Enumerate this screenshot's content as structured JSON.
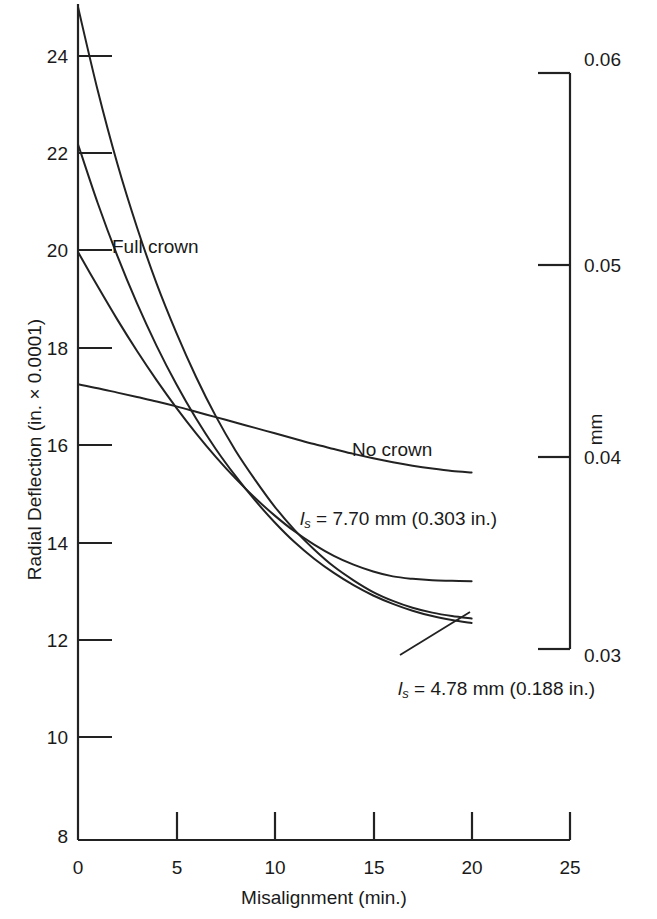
{
  "chart_data": {
    "type": "line",
    "title": "",
    "xlabel": "Misalignment (min.)",
    "ylabel": "Radial Deflection (in. × 0.0001)",
    "ylabel_right": "mm",
    "xlim": [
      0,
      25
    ],
    "ylim": [
      8,
      25
    ],
    "ylim_right": [
      0.03,
      0.06
    ],
    "xticks": [
      "0",
      "5",
      "10",
      "15",
      "20",
      "25"
    ],
    "xtick_values": [
      0,
      5,
      10,
      15,
      20,
      25
    ],
    "yticks": [
      "8",
      "10",
      "12",
      "14",
      "16",
      "18",
      "20",
      "22",
      "24"
    ],
    "ytick_values": [
      8,
      10,
      12,
      14,
      16,
      18,
      20,
      22,
      24
    ],
    "yticks_right": [
      "0.03",
      "0.04",
      "0.05",
      "0.06"
    ],
    "ytick_right_values": [
      0.03,
      0.04,
      0.05,
      0.06
    ],
    "grid": false,
    "legend": "inline-annotations",
    "x": [
      0,
      1,
      2,
      3,
      4,
      5,
      6,
      7,
      8,
      9,
      10,
      11,
      12,
      13,
      14,
      15,
      16,
      17,
      18,
      19,
      20
    ],
    "series": [
      {
        "name": "No crown",
        "label": "No crown",
        "values": [
          17.3,
          17.22,
          17.13,
          17.04,
          16.95,
          16.85,
          16.74,
          16.63,
          16.52,
          16.41,
          16.3,
          16.19,
          16.08,
          15.98,
          15.88,
          15.79,
          15.71,
          15.64,
          15.58,
          15.53,
          15.5
        ]
      },
      {
        "name": "ls = 7.70 mm (0.303 in.)",
        "label_main": "= 7.70 mm (0.303 in.)",
        "label_symbol": "l",
        "label_sub": "s",
        "values": [
          20.0,
          19.3,
          18.62,
          17.98,
          17.38,
          16.82,
          16.3,
          15.82,
          15.38,
          14.98,
          14.62,
          14.3,
          14.03,
          13.8,
          13.62,
          13.48,
          13.38,
          13.33,
          13.3,
          13.29,
          13.28
        ]
      },
      {
        "name": "Full crown",
        "label": "Full crown",
        "values": [
          25.0,
          23.3,
          21.8,
          20.5,
          19.35,
          18.35,
          17.45,
          16.65,
          15.95,
          15.35,
          14.8,
          14.33,
          13.93,
          13.58,
          13.3,
          13.06,
          12.88,
          12.74,
          12.64,
          12.57,
          12.52
        ]
      },
      {
        "name": "ls = 4.78 mm (0.188 in.)",
        "label_main": "= 4.78 mm (0.188 in.)",
        "label_symbol": "l",
        "label_sub": "s",
        "values": [
          22.2,
          21.0,
          19.92,
          18.95,
          18.08,
          17.3,
          16.6,
          15.98,
          15.43,
          14.93,
          14.48,
          14.08,
          13.74,
          13.45,
          13.2,
          12.99,
          12.82,
          12.68,
          12.57,
          12.49,
          12.43
        ]
      }
    ],
    "annotations": [
      {
        "text": "Full crown",
        "x_px": 112,
        "y_px": 237
      },
      {
        "text": "No crown",
        "x_px": 352,
        "y_px": 440
      },
      {
        "text": "= 7.70 mm (0.303 in.)",
        "symbol": "l",
        "sub": "s",
        "x_px": 300,
        "y_px": 509
      },
      {
        "text": "= 4.78 mm (0.188 in.)",
        "symbol": "l",
        "sub": "s",
        "x_px": 398,
        "y_px": 679
      }
    ],
    "colors": {
      "line": "#222222",
      "axis": "#222222",
      "background": "#ffffff"
    }
  },
  "axes": {
    "left_label": "Radial Deflection (in. × 0.0001)",
    "right_label": "mm",
    "bottom_label": "Misalignment (min.)"
  }
}
